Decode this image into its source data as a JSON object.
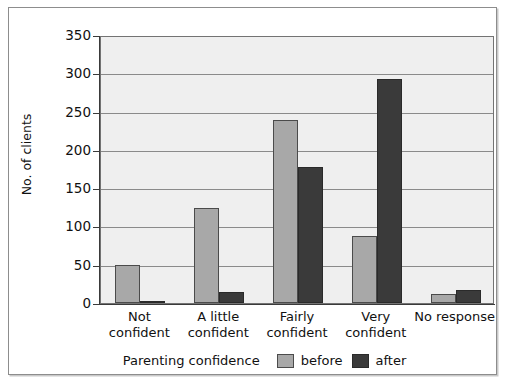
{
  "chart_data": {
    "type": "bar",
    "title": "",
    "xlabel": "Parenting confidence",
    "ylabel": "No. of clients",
    "ylim": [
      0,
      350
    ],
    "yticks": [
      0,
      50,
      100,
      150,
      200,
      250,
      300,
      350
    ],
    "ytick_labels": [
      "0",
      "50",
      "100",
      "150",
      "200",
      "250",
      "300",
      "350"
    ],
    "grid": true,
    "legend_position": "bottom",
    "categories": [
      "Not confident",
      "A little confident",
      "Fairly confident",
      "Very confident",
      "No response"
    ],
    "category_lines": [
      [
        "Not",
        "confident"
      ],
      [
        "A little",
        "confident"
      ],
      [
        "Fairly",
        "confident"
      ],
      [
        "Very",
        "confident"
      ],
      [
        "No response",
        ""
      ]
    ],
    "series": [
      {
        "name": "before",
        "color": "#a8a8a8",
        "values": [
          50,
          124,
          239,
          88,
          12
        ]
      },
      {
        "name": "after",
        "color": "#3a3a3a",
        "values": [
          2,
          14,
          178,
          293,
          17
        ]
      }
    ]
  },
  "legend": {
    "title": "Parenting confidence",
    "entries": [
      {
        "label": "before",
        "color": "#a8a8a8"
      },
      {
        "label": "after",
        "color": "#3a3a3a"
      }
    ]
  },
  "colors": {
    "plot_background": "#efefef",
    "gridline": "#8a8a8a",
    "axis": "#3a3a3a",
    "frame_border": "#8d8d8d",
    "before_bar": "#a8a8a8",
    "after_bar": "#3a3a3a"
  }
}
